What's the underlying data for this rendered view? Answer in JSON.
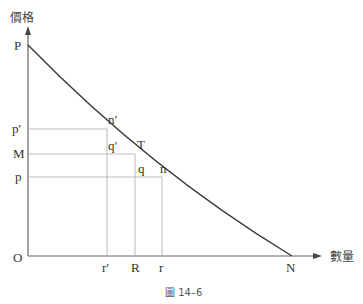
{
  "axes": {
    "y_label": "價格",
    "x_label": "數量",
    "origin": "O"
  },
  "points": {
    "P": "P",
    "N": "N",
    "n_prime": "n′",
    "q_prime": "q′",
    "T": "T",
    "q": "q",
    "n": "n"
  },
  "y_ticks": {
    "p_prime": "p′",
    "M": "M",
    "p": "p"
  },
  "x_ticks": {
    "r_prime": "r′",
    "R": "R",
    "r": "r"
  },
  "caption": "圖 14–6"
}
